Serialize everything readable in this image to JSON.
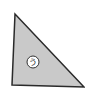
{
  "diagram": {
    "shape": "right-triangle",
    "fill_color": "#c9c9c9",
    "stroke_color": "#2a2a2a",
    "vertices": [
      [
        15,
        14
      ],
      [
        12,
        85
      ],
      [
        84,
        87
      ]
    ],
    "marker": {
      "label": "う",
      "center": [
        33,
        62
      ],
      "radius": 6,
      "fill_color": "#ffffff"
    }
  }
}
